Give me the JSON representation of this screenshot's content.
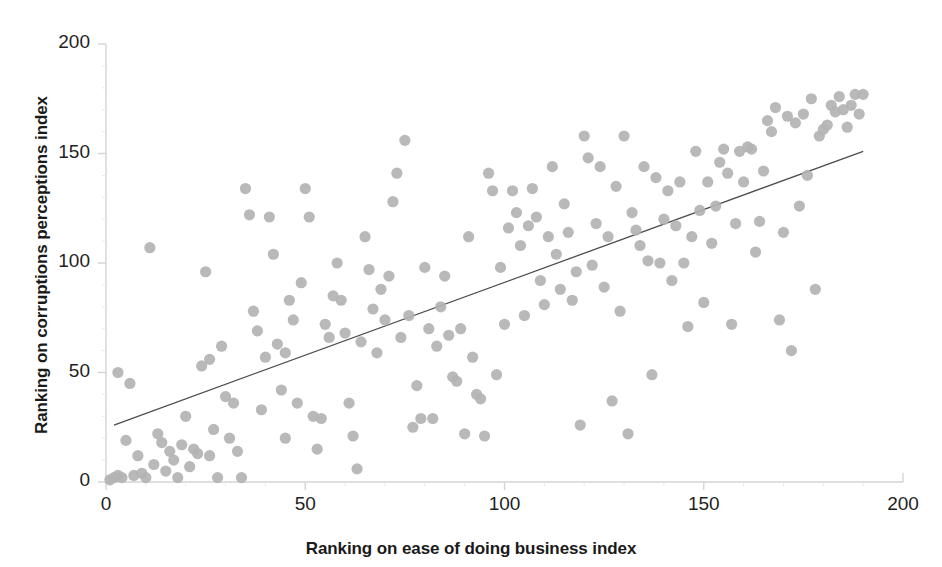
{
  "chart_data": {
    "type": "scatter",
    "title": "",
    "xlabel": "Ranking on ease of doing business index",
    "ylabel": "Ranking on corruptions perceptions index",
    "xlim": [
      0,
      200
    ],
    "ylim": [
      0,
      200
    ],
    "xticks": [
      0,
      50,
      100,
      150,
      200
    ],
    "yticks": [
      0,
      50,
      100,
      150,
      200
    ],
    "grid": false,
    "legend": null,
    "marker_color": "#b3b3b3",
    "trendline_color": "#4d4d4d",
    "axis_color": "#d4d4d4",
    "trendline": {
      "x0": 2,
      "y0": 26,
      "x1": 190,
      "y1": 151
    },
    "points": [
      [
        1,
        1
      ],
      [
        2,
        2
      ],
      [
        3,
        50
      ],
      [
        3,
        3
      ],
      [
        4,
        2
      ],
      [
        5,
        19
      ],
      [
        6,
        45
      ],
      [
        7,
        3
      ],
      [
        8,
        12
      ],
      [
        9,
        4
      ],
      [
        10,
        2
      ],
      [
        11,
        107
      ],
      [
        12,
        8
      ],
      [
        13,
        22
      ],
      [
        14,
        18
      ],
      [
        15,
        5
      ],
      [
        16,
        14
      ],
      [
        17,
        10
      ],
      [
        18,
        2
      ],
      [
        19,
        17
      ],
      [
        20,
        30
      ],
      [
        21,
        7
      ],
      [
        22,
        15
      ],
      [
        23,
        13
      ],
      [
        24,
        53
      ],
      [
        25,
        96
      ],
      [
        26,
        56
      ],
      [
        26,
        12
      ],
      [
        27,
        24
      ],
      [
        28,
        2
      ],
      [
        29,
        62
      ],
      [
        30,
        39
      ],
      [
        31,
        20
      ],
      [
        32,
        36
      ],
      [
        33,
        14
      ],
      [
        34,
        2
      ],
      [
        35,
        134
      ],
      [
        36,
        122
      ],
      [
        37,
        78
      ],
      [
        38,
        69
      ],
      [
        39,
        33
      ],
      [
        40,
        57
      ],
      [
        41,
        121
      ],
      [
        42,
        104
      ],
      [
        43,
        63
      ],
      [
        44,
        42
      ],
      [
        45,
        59
      ],
      [
        45,
        20
      ],
      [
        46,
        83
      ],
      [
        47,
        74
      ],
      [
        48,
        36
      ],
      [
        49,
        91
      ],
      [
        50,
        134
      ],
      [
        51,
        121
      ],
      [
        52,
        30
      ],
      [
        53,
        15
      ],
      [
        54,
        29
      ],
      [
        55,
        72
      ],
      [
        56,
        66
      ],
      [
        57,
        85
      ],
      [
        58,
        100
      ],
      [
        59,
        83
      ],
      [
        60,
        68
      ],
      [
        61,
        36
      ],
      [
        62,
        21
      ],
      [
        63,
        6
      ],
      [
        64,
        64
      ],
      [
        65,
        112
      ],
      [
        66,
        97
      ],
      [
        67,
        79
      ],
      [
        68,
        59
      ],
      [
        69,
        88
      ],
      [
        70,
        74
      ],
      [
        71,
        94
      ],
      [
        72,
        128
      ],
      [
        73,
        141
      ],
      [
        74,
        66
      ],
      [
        75,
        156
      ],
      [
        76,
        76
      ],
      [
        77,
        25
      ],
      [
        78,
        44
      ],
      [
        79,
        29
      ],
      [
        80,
        98
      ],
      [
        81,
        70
      ],
      [
        82,
        29
      ],
      [
        83,
        62
      ],
      [
        84,
        80
      ],
      [
        85,
        94
      ],
      [
        86,
        67
      ],
      [
        87,
        48
      ],
      [
        88,
        46
      ],
      [
        89,
        70
      ],
      [
        90,
        22
      ],
      [
        91,
        112
      ],
      [
        92,
        57
      ],
      [
        93,
        40
      ],
      [
        94,
        38
      ],
      [
        95,
        21
      ],
      [
        96,
        141
      ],
      [
        97,
        133
      ],
      [
        98,
        49
      ],
      [
        99,
        98
      ],
      [
        100,
        72
      ],
      [
        101,
        116
      ],
      [
        102,
        133
      ],
      [
        103,
        123
      ],
      [
        104,
        108
      ],
      [
        105,
        76
      ],
      [
        106,
        117
      ],
      [
        107,
        134
      ],
      [
        108,
        121
      ],
      [
        109,
        92
      ],
      [
        110,
        81
      ],
      [
        111,
        112
      ],
      [
        112,
        144
      ],
      [
        113,
        104
      ],
      [
        114,
        88
      ],
      [
        115,
        127
      ],
      [
        116,
        114
      ],
      [
        117,
        83
      ],
      [
        118,
        96
      ],
      [
        119,
        26
      ],
      [
        120,
        158
      ],
      [
        121,
        148
      ],
      [
        122,
        99
      ],
      [
        123,
        118
      ],
      [
        124,
        144
      ],
      [
        125,
        89
      ],
      [
        126,
        112
      ],
      [
        127,
        37
      ],
      [
        128,
        135
      ],
      [
        129,
        78
      ],
      [
        130,
        158
      ],
      [
        131,
        22
      ],
      [
        132,
        123
      ],
      [
        133,
        115
      ],
      [
        134,
        108
      ],
      [
        135,
        144
      ],
      [
        136,
        101
      ],
      [
        137,
        49
      ],
      [
        138,
        139
      ],
      [
        139,
        100
      ],
      [
        140,
        120
      ],
      [
        141,
        133
      ],
      [
        142,
        92
      ],
      [
        143,
        117
      ],
      [
        144,
        137
      ],
      [
        145,
        100
      ],
      [
        146,
        71
      ],
      [
        147,
        112
      ],
      [
        148,
        151
      ],
      [
        149,
        124
      ],
      [
        150,
        82
      ],
      [
        151,
        137
      ],
      [
        152,
        109
      ],
      [
        153,
        126
      ],
      [
        154,
        146
      ],
      [
        155,
        152
      ],
      [
        156,
        141
      ],
      [
        157,
        72
      ],
      [
        158,
        118
      ],
      [
        159,
        151
      ],
      [
        160,
        137
      ],
      [
        161,
        153
      ],
      [
        162,
        152
      ],
      [
        163,
        105
      ],
      [
        164,
        119
      ],
      [
        165,
        142
      ],
      [
        166,
        165
      ],
      [
        167,
        160
      ],
      [
        168,
        171
      ],
      [
        169,
        74
      ],
      [
        170,
        114
      ],
      [
        171,
        167
      ],
      [
        172,
        60
      ],
      [
        173,
        164
      ],
      [
        174,
        126
      ],
      [
        175,
        168
      ],
      [
        176,
        140
      ],
      [
        177,
        175
      ],
      [
        178,
        88
      ],
      [
        179,
        158
      ],
      [
        180,
        161
      ],
      [
        181,
        163
      ],
      [
        182,
        172
      ],
      [
        183,
        169
      ],
      [
        184,
        176
      ],
      [
        185,
        170
      ],
      [
        186,
        162
      ],
      [
        187,
        172
      ],
      [
        188,
        177
      ],
      [
        189,
        168
      ],
      [
        190,
        177
      ]
    ]
  }
}
